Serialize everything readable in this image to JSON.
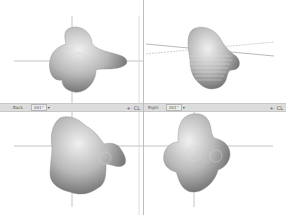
{
  "viewports": [
    {
      "id": "top-left",
      "name": "front-view"
    },
    {
      "id": "top-right",
      "name": "perspective-view"
    },
    {
      "id": "bottom-left",
      "name": "back-view"
    },
    {
      "id": "bottom-right",
      "name": "right-view"
    }
  ],
  "toolbars": {
    "left": {
      "view_label": "Back",
      "angle_value": "001°",
      "dropdown_icon": "▾",
      "add_icon": "+",
      "extra_icon": "CL"
    },
    "right": {
      "view_label": "Right",
      "angle_value": "001°",
      "dropdown_icon": "▾",
      "add_icon": "+",
      "extra_icon": "CL"
    }
  },
  "colors": {
    "toolbar_bg": "#dcdcdc",
    "crosshair": "#9a9a9a",
    "object_light": "#e2e2e2",
    "object_dark": "#6e6e6e"
  }
}
